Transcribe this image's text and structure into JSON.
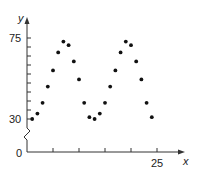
{
  "chart_data": {
    "type": "scatter",
    "title": "",
    "xlabel": "x",
    "ylabel": "y",
    "x_ticks": [
      5,
      10,
      15,
      20,
      25
    ],
    "x_tick_labels": [
      "",
      "",
      "",
      "",
      "25"
    ],
    "y_ticks": [
      30,
      35,
      40,
      45,
      50,
      55,
      60,
      65,
      70,
      75
    ],
    "y_tick_labels": {
      "30": "30",
      "75": "75"
    },
    "origin_label": "0",
    "y_axis_break": true,
    "xlim": [
      0,
      27
    ],
    "ylim": [
      0,
      80
    ],
    "grid": false,
    "legend": null,
    "series": [
      {
        "name": "data",
        "x": [
          1,
          2,
          3,
          4,
          5,
          6,
          7,
          8,
          9,
          10,
          11,
          12,
          13,
          14,
          15,
          16,
          17,
          18,
          19,
          20,
          21,
          22,
          23,
          24
        ],
        "y": [
          30,
          33,
          39,
          48,
          57,
          67,
          73,
          71,
          62,
          52,
          39,
          31,
          30,
          33,
          39,
          48,
          57,
          67,
          73,
          71,
          62,
          52,
          39,
          31
        ]
      }
    ]
  },
  "labels": {
    "y_axis": "y",
    "x_axis": "x",
    "y_top": "75",
    "y_bottom": "30",
    "origin": "0",
    "x_last": "25"
  },
  "colors": {
    "axis": "#333333",
    "points": "#111111"
  }
}
